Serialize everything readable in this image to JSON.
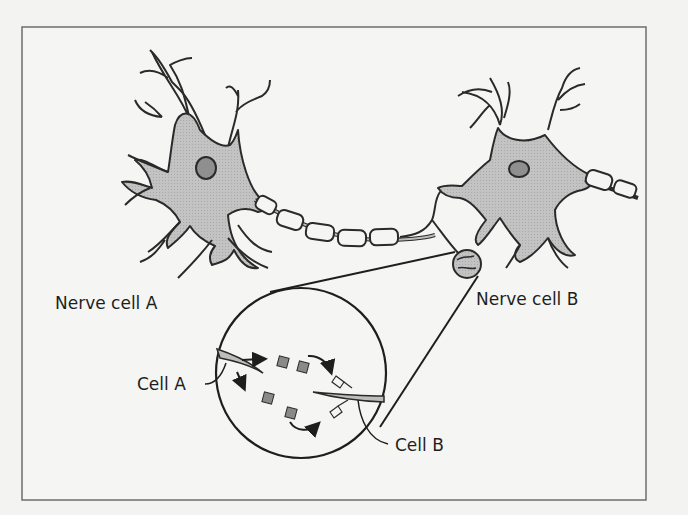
{
  "figure": {
    "type": "synapse-diagram",
    "colors": {
      "background": "#f3f3f1",
      "frame": "#6e6e6e",
      "cell_fill": "#bdbdbd",
      "nucleus_fill": "#8f8f8f",
      "outline": "#2a2a2a",
      "neurotransmitter": "#8a8a8a"
    },
    "labels": {
      "nerve_cell_a": "Nerve cell A",
      "nerve_cell_b": "Nerve cell B",
      "cell_a": "Cell A",
      "cell_b": "Cell B"
    },
    "inset": {
      "description": "Magnified synapse view",
      "neurotransmitter_count": 4,
      "receptor_count": 2,
      "arrow_count": 4
    }
  }
}
